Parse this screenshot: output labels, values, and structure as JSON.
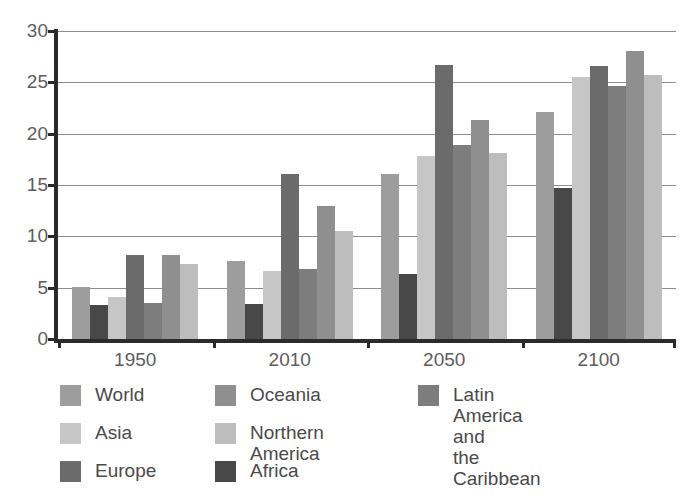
{
  "chart_data": {
    "type": "bar",
    "title": "",
    "subtitle": "",
    "xlabel": "",
    "ylabel": "",
    "categories": [
      "1950",
      "2010",
      "2050",
      "2100"
    ],
    "ylim": [
      0,
      30
    ],
    "yticks": [
      0,
      5,
      10,
      15,
      20,
      25,
      30
    ],
    "ytick_labels": [
      "0",
      "5",
      "10",
      "15",
      "20",
      "25",
      "30"
    ],
    "grid": true,
    "legend_position": "bottom",
    "series": [
      {
        "name": "World",
        "color": "#9d9d9d",
        "values": [
          5.1,
          7.6,
          16.1,
          22.1
        ]
      },
      {
        "name": "Asia",
        "color": "#c6c6c6",
        "values": [
          4.1,
          6.6,
          17.8,
          25.5
        ]
      },
      {
        "name": "Europe",
        "color": "#6b6b6b",
        "values": [
          8.2,
          16.1,
          26.7,
          26.6
        ]
      },
      {
        "name": "Oceania",
        "color": "#8f8f8f",
        "values": [
          8.2,
          13.0,
          21.3,
          28.1
        ]
      },
      {
        "name": "Northern America",
        "color": "#bdbdbd",
        "values": [
          7.3,
          10.5,
          18.1,
          25.7
        ]
      },
      {
        "name": "Africa",
        "color": "#484848",
        "values": [
          3.3,
          3.4,
          6.3,
          14.7
        ]
      },
      {
        "name": "Latin America and\nthe Caribbean",
        "color": "#7d7d7d",
        "values": [
          3.5,
          6.8,
          18.9,
          24.6
        ]
      }
    ],
    "bar_draw_order": [
      0,
      5,
      1,
      2,
      6,
      3,
      4
    ]
  },
  "legend": {
    "columns": [
      {
        "items": [
          {
            "label": "World",
            "color": "#9d9d9d"
          },
          {
            "label": "Asia",
            "color": "#c6c6c6"
          },
          {
            "label": "Europe",
            "color": "#6b6b6b"
          }
        ]
      },
      {
        "items": [
          {
            "label": "Oceania",
            "color": "#8f8f8f"
          },
          {
            "label": "Northern America",
            "color": "#bdbdbd"
          },
          {
            "label": "Africa",
            "color": "#484848"
          }
        ]
      },
      {
        "items": [
          {
            "label": "Latin America and\nthe Caribbean",
            "color": "#7d7d7d"
          }
        ]
      }
    ]
  },
  "colors": {
    "axis": "#2b2b2b",
    "gridline": "#8d8d8d",
    "tick_text": "#5d5d5d",
    "legend_text": "#4a4a4a",
    "background": "#ffffff"
  }
}
